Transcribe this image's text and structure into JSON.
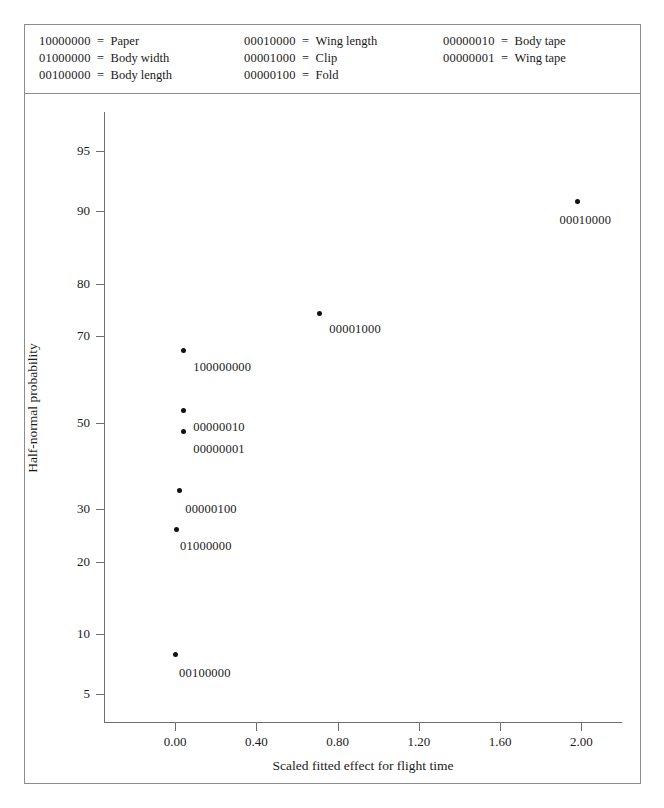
{
  "figure": {
    "kind": "half-normal-probability-plot"
  },
  "legend": {
    "separator": "=",
    "columns": [
      [
        {
          "code": "10000000",
          "label": "Paper"
        },
        {
          "code": "01000000",
          "label": "Body width"
        },
        {
          "code": "00100000",
          "label": "Body length"
        }
      ],
      [
        {
          "code": "00010000",
          "label": "Wing length"
        },
        {
          "code": "00001000",
          "label": "Clip"
        },
        {
          "code": "00000100",
          "label": "Fold"
        }
      ],
      [
        {
          "code": "00000010",
          "label": "Body tape"
        },
        {
          "code": "00000001",
          "label": "Wing tape"
        }
      ]
    ]
  },
  "chart_data": {
    "type": "scatter",
    "title": "",
    "xlabel": "Scaled fitted effect for flight time",
    "ylabel": "Half-normal probability",
    "xlim": [
      -0.35,
      2.2
    ],
    "ylim": [
      3.5,
      97.0
    ],
    "grid": false,
    "legend_position": "top-box",
    "xticks": [
      0.0,
      0.4,
      0.8,
      1.2,
      1.6,
      2.0
    ],
    "xticklabels": [
      "0.00",
      "0.40",
      "0.80",
      "1.20",
      "1.60",
      "2.00"
    ],
    "yticks": [
      5,
      10,
      20,
      30,
      50,
      70,
      80,
      90,
      95
    ],
    "yticklabels": [
      "5",
      "10",
      "20",
      "30",
      "50",
      "70",
      "80",
      "90",
      "95"
    ],
    "marker": "filled-circle",
    "marker_color": "#111111",
    "points": [
      {
        "label": "00010000",
        "x": 1.98,
        "y": 91.0,
        "label_dx": 8,
        "label_dy": 12,
        "label_align": "center"
      },
      {
        "label": "00001000",
        "x": 0.71,
        "y": 74.5,
        "label_dx": 10,
        "label_dy": 8,
        "label_align": "left"
      },
      {
        "label": "100000000",
        "x": 0.04,
        "y": 67.0,
        "label_dx": 10,
        "label_dy": 10,
        "label_align": "left"
      },
      {
        "label": "00000010",
        "x": 0.04,
        "y": 53.0,
        "label_dx": 10,
        "label_dy": 10,
        "label_align": "left"
      },
      {
        "label": "00000001",
        "x": 0.04,
        "y": 48.0,
        "label_dx": 10,
        "label_dy": 11,
        "label_align": "left"
      },
      {
        "label": "00000100",
        "x": 0.02,
        "y": 34.0,
        "label_dx": 6,
        "label_dy": 11,
        "label_align": "left"
      },
      {
        "label": "01000000",
        "x": 0.005,
        "y": 26.0,
        "label_dx": 4,
        "label_dy": 10,
        "label_align": "left"
      },
      {
        "label": "00100000",
        "x": 0.0,
        "y": 8.0,
        "label_dx": 4,
        "label_dy": 11,
        "label_align": "left"
      }
    ]
  },
  "colors": {
    "frame": "#8c8c8c",
    "axis": "#6e6e6e",
    "marker": "#111111",
    "text": "#1a1a1a",
    "background": "#ffffff"
  }
}
